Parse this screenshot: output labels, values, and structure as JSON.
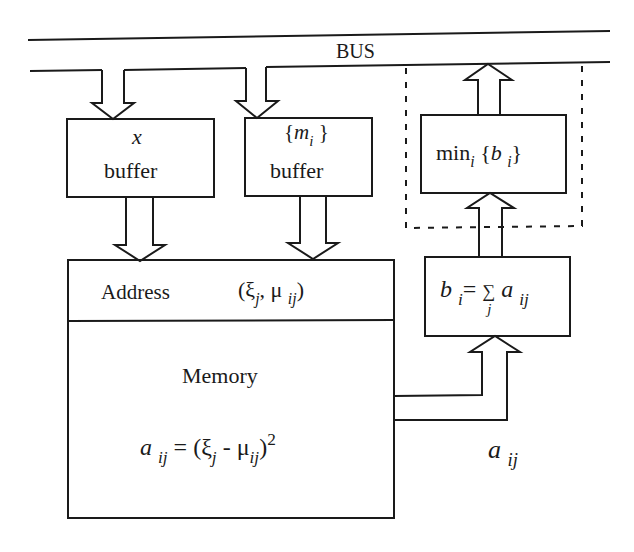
{
  "diagram": {
    "bus": {
      "label": "BUS"
    },
    "x_buffer": {
      "var": "x",
      "label": "buffer"
    },
    "m_buffer": {
      "open": "{",
      "var": "m",
      "sub": "i",
      "close": "}",
      "label": "buffer"
    },
    "min_block": {
      "fn": "min",
      "fn_sub": "i",
      "open": "{",
      "var": "b",
      "var_sub": "i",
      "close": "}"
    },
    "sum_block": {
      "lhs": "b",
      "lhs_sub": "i",
      "eq": "=",
      "sigma": "∑",
      "sigma_sub": "j",
      "rhs": "a",
      "rhs_sub": "ij"
    },
    "memory": {
      "address_label": "Address",
      "address_expr": {
        "open": "(",
        "xi": "ξ",
        "xi_sub": "j",
        "comma": ",",
        "mu": "μ",
        "mu_sub": "ij",
        "close": ")"
      },
      "title": "Memory",
      "formula": {
        "lhs": "a",
        "lhs_sub": "ij",
        "eq": "=",
        "open": "(",
        "xi": "ξ",
        "xi_sub": "j",
        "minus": "-",
        "mu": "μ",
        "mu_sub": "ij",
        "close": ")",
        "exp": "2"
      }
    },
    "output_label": {
      "var": "a",
      "sub": "ij"
    }
  }
}
